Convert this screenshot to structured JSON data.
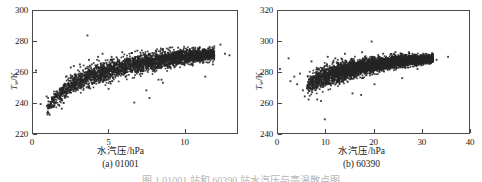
{
  "figure": {
    "caption_clipped": "图 1  01001 站和 60390 站水汽压与亮温散点图"
  },
  "panels": [
    {
      "id": "panel-a",
      "caption": "(a) 01001",
      "station": "01001",
      "x_axis_title": "水汽压/hPa",
      "y_axis_title_var": "T",
      "y_axis_title_sub": "w",
      "y_axis_title_unit": "/K"
    },
    {
      "id": "panel-b",
      "caption": "(b) 60390",
      "station": "60390",
      "x_axis_title": "水汽压/hPa",
      "y_axis_title_var": "T",
      "y_axis_title_sub": "w",
      "y_axis_title_unit": "/K"
    }
  ],
  "chart_data": [
    {
      "type": "scatter",
      "panel": "(a) 01001",
      "title": "",
      "xlabel": "水汽压/hPa",
      "ylabel": "T_w/K",
      "xlim": [
        0,
        13.5
      ],
      "ylim": [
        220,
        300
      ],
      "xticks": [
        0,
        5,
        10
      ],
      "yticks": [
        220,
        240,
        260,
        280,
        300
      ],
      "grid": false,
      "legend": "none",
      "marker_color": "#262626",
      "marker_size_px": 1.6,
      "n_points_approx": 3200,
      "description": "Dense rising band of water-vapour-pressure vs brightness temperature; bulk runs from about (1,235) up to (12,272), widening then flattening, with scattered outliers above and below the main band.",
      "cluster_spine": [
        {
          "x": 0.9,
          "y": 236
        },
        {
          "x": 1.5,
          "y": 243
        },
        {
          "x": 2.2,
          "y": 249
        },
        {
          "x": 3.0,
          "y": 254
        },
        {
          "x": 4.0,
          "y": 258
        },
        {
          "x": 5.0,
          "y": 261
        },
        {
          "x": 6.0,
          "y": 263.5
        },
        {
          "x": 7.0,
          "y": 265.5
        },
        {
          "x": 8.0,
          "y": 267
        },
        {
          "x": 9.0,
          "y": 268.5
        },
        {
          "x": 10.0,
          "y": 270
        },
        {
          "x": 11.0,
          "y": 271
        },
        {
          "x": 12.0,
          "y": 272
        }
      ],
      "band_halfwidth": [
        {
          "x": 0.9,
          "half": 4.5
        },
        {
          "x": 2.2,
          "half": 6.5
        },
        {
          "x": 4.0,
          "half": 7.5
        },
        {
          "x": 6.0,
          "half": 7.0
        },
        {
          "x": 8.0,
          "half": 6.5
        },
        {
          "x": 10.0,
          "half": 5.5
        },
        {
          "x": 12.0,
          "half": 4.0
        }
      ],
      "outliers": [
        {
          "x": 0.2,
          "y": 261
        },
        {
          "x": 0.5,
          "y": 239
        },
        {
          "x": 0.9,
          "y": 244
        },
        {
          "x": 1.0,
          "y": 243
        },
        {
          "x": 1.1,
          "y": 232
        },
        {
          "x": 1.9,
          "y": 236
        },
        {
          "x": 2.5,
          "y": 263
        },
        {
          "x": 2.7,
          "y": 264
        },
        {
          "x": 3.1,
          "y": 265
        },
        {
          "x": 3.6,
          "y": 284
        },
        {
          "x": 3.7,
          "y": 268
        },
        {
          "x": 4.3,
          "y": 270
        },
        {
          "x": 4.6,
          "y": 272
        },
        {
          "x": 5.0,
          "y": 249
        },
        {
          "x": 5.2,
          "y": 270
        },
        {
          "x": 5.9,
          "y": 273
        },
        {
          "x": 6.7,
          "y": 240
        },
        {
          "x": 6.9,
          "y": 274
        },
        {
          "x": 7.5,
          "y": 248
        },
        {
          "x": 7.7,
          "y": 243
        },
        {
          "x": 8.3,
          "y": 255
        },
        {
          "x": 8.5,
          "y": 255
        },
        {
          "x": 8.6,
          "y": 253
        },
        {
          "x": 9.6,
          "y": 276
        },
        {
          "x": 10.6,
          "y": 276
        },
        {
          "x": 11.4,
          "y": 257
        },
        {
          "x": 11.9,
          "y": 265
        },
        {
          "x": 12.4,
          "y": 278
        },
        {
          "x": 12.7,
          "y": 272
        },
        {
          "x": 13.0,
          "y": 271
        }
      ]
    },
    {
      "type": "scatter",
      "panel": "(b) 60390",
      "title": "",
      "xlabel": "水汽压/hPa",
      "ylabel": "T_w/K",
      "xlim": [
        0,
        40
      ],
      "ylim": [
        240,
        320
      ],
      "xticks": [
        0,
        10,
        20,
        30,
        40
      ],
      "yticks": [
        240,
        260,
        280,
        300,
        320
      ],
      "grid": false,
      "legend": "none",
      "marker_color": "#262626",
      "marker_size_px": 1.6,
      "n_points_approx": 4200,
      "description": "Dense rising band from about (6,266) to (32,290); steep lower edge near 6-10 hPa then a gently sloping plateau, with scattered outliers including a low point near (10,249).",
      "cluster_spine": [
        {
          "x": 6.0,
          "y": 271
        },
        {
          "x": 7.5,
          "y": 274
        },
        {
          "x": 9.0,
          "y": 276
        },
        {
          "x": 11.0,
          "y": 278
        },
        {
          "x": 13.0,
          "y": 280
        },
        {
          "x": 15.0,
          "y": 281.5
        },
        {
          "x": 17.0,
          "y": 283
        },
        {
          "x": 19.0,
          "y": 284
        },
        {
          "x": 21.0,
          "y": 285
        },
        {
          "x": 23.0,
          "y": 286
        },
        {
          "x": 25.0,
          "y": 287
        },
        {
          "x": 27.0,
          "y": 287.5
        },
        {
          "x": 29.0,
          "y": 288
        },
        {
          "x": 31.0,
          "y": 288.5
        },
        {
          "x": 32.5,
          "y": 289
        }
      ],
      "band_halfwidth": [
        {
          "x": 6.0,
          "half": 6.0
        },
        {
          "x": 9.0,
          "half": 7.5
        },
        {
          "x": 13.0,
          "half": 7.0
        },
        {
          "x": 17.0,
          "half": 6.0
        },
        {
          "x": 21.0,
          "half": 5.0
        },
        {
          "x": 25.0,
          "half": 4.2
        },
        {
          "x": 29.0,
          "half": 3.4
        },
        {
          "x": 32.5,
          "half": 2.6
        }
      ],
      "outliers": [
        {
          "x": 0.4,
          "y": 282
        },
        {
          "x": 2.2,
          "y": 289
        },
        {
          "x": 2.6,
          "y": 274
        },
        {
          "x": 3.4,
          "y": 277
        },
        {
          "x": 4.0,
          "y": 272
        },
        {
          "x": 4.6,
          "y": 279
        },
        {
          "x": 5.2,
          "y": 268
        },
        {
          "x": 5.6,
          "y": 264
        },
        {
          "x": 6.4,
          "y": 262
        },
        {
          "x": 7.0,
          "y": 287
        },
        {
          "x": 8.2,
          "y": 262
        },
        {
          "x": 9.0,
          "y": 261
        },
        {
          "x": 9.8,
          "y": 249
        },
        {
          "x": 10.4,
          "y": 290
        },
        {
          "x": 12.0,
          "y": 289
        },
        {
          "x": 14.0,
          "y": 292
        },
        {
          "x": 15.6,
          "y": 266
        },
        {
          "x": 17.4,
          "y": 265
        },
        {
          "x": 17.6,
          "y": 293
        },
        {
          "x": 19.6,
          "y": 300
        },
        {
          "x": 20.2,
          "y": 272
        },
        {
          "x": 22.0,
          "y": 292
        },
        {
          "x": 24.6,
          "y": 293
        },
        {
          "x": 26.0,
          "y": 276
        },
        {
          "x": 27.4,
          "y": 293
        },
        {
          "x": 29.2,
          "y": 282
        },
        {
          "x": 30.4,
          "y": 292
        },
        {
          "x": 32.0,
          "y": 286
        },
        {
          "x": 33.2,
          "y": 288
        },
        {
          "x": 35.6,
          "y": 290
        }
      ]
    }
  ]
}
